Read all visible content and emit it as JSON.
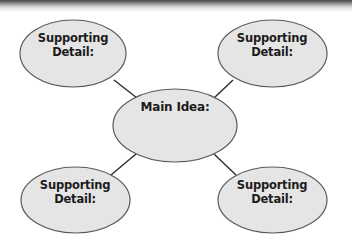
{
  "diagram": {
    "type": "main-idea-supporting-details-web",
    "colors": {
      "node_fill": "#e5e5e5",
      "node_stroke": "#5a5a5a",
      "connector": "#2a2a2a",
      "text": "#1c1c1c",
      "top_bar": "#4a4a4a"
    },
    "main_node": {
      "label": "Main Idea:"
    },
    "detail_nodes": [
      {
        "position": "top-left",
        "line1": "Supporting",
        "line2": "Detail:"
      },
      {
        "position": "top-right",
        "line1": "Supporting",
        "line2": "Detail:"
      },
      {
        "position": "bottom-left",
        "line1": "Supporting",
        "line2": "Detail:"
      },
      {
        "position": "bottom-right",
        "line1": "Supporting",
        "line2": "Detail:"
      }
    ]
  }
}
